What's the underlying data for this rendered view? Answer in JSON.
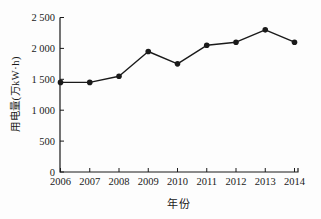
{
  "figure": {
    "background": "#fdfdfd",
    "ink_color": "#1a1a1a"
  },
  "chart_data": {
    "type": "line",
    "xlabel": "年份",
    "ylabel": "用电量(万kW·h)",
    "categories": [
      "2006",
      "2007",
      "2008",
      "2009",
      "2010",
      "2011",
      "2012",
      "2013",
      "2014"
    ],
    "series": [
      {
        "name": "用电量",
        "values": [
          1450,
          1450,
          1550,
          1950,
          1750,
          2050,
          2100,
          2300,
          2100
        ],
        "color": "#1a1a1a",
        "marker": "filled-circle"
      }
    ],
    "ylim": [
      0,
      2500
    ],
    "yticks": [
      0,
      500,
      1000,
      1500,
      2000,
      2500
    ],
    "ytick_labels": [
      "0",
      "500",
      "1 000",
      "1 500",
      "2 000",
      "2 500"
    ],
    "grid": false,
    "legend": "none"
  }
}
